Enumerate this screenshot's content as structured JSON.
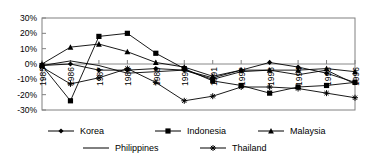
{
  "chart_data": {
    "type": "line",
    "title": "",
    "xlabel": "",
    "ylabel": "",
    "categories": [
      "1985",
      "1986",
      "1987",
      "1988",
      "1989",
      "1990",
      "1991",
      "1992",
      "1993",
      "1994",
      "1995",
      "1996"
    ],
    "ylim": [
      -30,
      30
    ],
    "ytick_labels": [
      "30%",
      "20%",
      "10%",
      "0%",
      "-10%",
      "-20%",
      "-30%"
    ],
    "ytick_values": [
      30,
      20,
      10,
      0,
      -10,
      -20,
      -30
    ],
    "grid": false,
    "legend_position": "bottom",
    "series": [
      {
        "name": "Korea",
        "marker": "diamond",
        "values": [
          -1,
          0,
          -4,
          -4,
          -3,
          -4,
          -9,
          -4,
          1,
          -2,
          -6,
          -12
        ]
      },
      {
        "name": "Indonesia",
        "marker": "square",
        "values": [
          -1,
          -24,
          18,
          20,
          7,
          -3,
          -11,
          -14,
          -19,
          -15,
          -14,
          -12
        ]
      },
      {
        "name": "Malaysia",
        "marker": "triangle",
        "values": [
          0,
          11,
          13,
          8,
          1,
          -2,
          -8,
          -4,
          -4,
          -4,
          -3,
          -5
        ]
      },
      {
        "name": "Philippines",
        "marker": "none",
        "values": [
          -1,
          2,
          -1,
          -6,
          -5,
          -4,
          -10,
          -5,
          -4,
          -7,
          -4,
          -13
        ]
      },
      {
        "name": "Thailand",
        "marker": "asterisk",
        "values": [
          -2,
          -13,
          -9,
          -3,
          -12,
          -24,
          -21,
          -15,
          -15,
          -16,
          -19,
          -22
        ]
      }
    ]
  },
  "legend": {
    "items": [
      {
        "label": "Korea",
        "marker": "diamond"
      },
      {
        "label": "Indonesia",
        "marker": "square"
      },
      {
        "label": "Malaysia",
        "marker": "triangle"
      },
      {
        "label": "Philippines",
        "marker": "none"
      },
      {
        "label": "Thailand",
        "marker": "asterisk"
      }
    ]
  },
  "colors": {
    "line": "#000000",
    "axis": "#808080",
    "frame": "#808080",
    "background": "#ffffff"
  }
}
